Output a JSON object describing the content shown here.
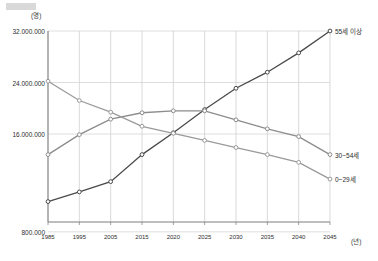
{
  "chart_data": {
    "type": "line",
    "title": "",
    "xlabel": "(년)",
    "ylabel": "(명)",
    "x": [
      1985,
      1995,
      2005,
      2015,
      2020,
      2025,
      2030,
      2035,
      2040,
      2045
    ],
    "categories": [
      "1985",
      "1995",
      "2005",
      "2015",
      "2020",
      "2025",
      "2030",
      "2035",
      "2040",
      "2045"
    ],
    "ylim": [
      0,
      32000000
    ],
    "yticks": [
      32000000,
      24000000,
      16000000,
      800000
    ],
    "ytick_labels": [
      "32.000.000",
      "24.000.000",
      "16.000.000",
      "800.000"
    ],
    "grid": true,
    "legend_position": "right-inline",
    "series": [
      {
        "name": "55세 이상",
        "color": "#4a4a4a",
        "values": [
          5500000,
          7000000,
          8600000,
          12800000,
          16200000,
          19800000,
          23100000,
          25600000,
          28600000,
          32000000
        ]
      },
      {
        "name": "30~54세",
        "color": "#8c8c8c",
        "values": [
          12800000,
          15900000,
          18300000,
          19300000,
          19600000,
          19600000,
          18200000,
          16800000,
          15600000,
          12800000
        ]
      },
      {
        "name": "0~29세",
        "color": "#9a9a9a",
        "values": [
          24200000,
          21200000,
          19400000,
          17200000,
          16100000,
          15000000,
          13900000,
          12800000,
          11600000,
          9000000
        ]
      }
    ]
  },
  "axis": {
    "y_unit": "(명)",
    "x_unit": "(년)"
  }
}
